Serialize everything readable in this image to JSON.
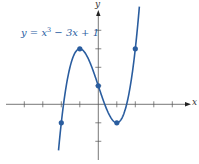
{
  "chart_data": {
    "type": "line",
    "title": "",
    "equation": {
      "prefix": "y = x",
      "exponent": "3",
      "suffix": " − 3x + 1"
    },
    "xlabel": "x",
    "ylabel": "y",
    "xlim": [
      -5,
      5
    ],
    "ylim": [
      -3,
      5
    ],
    "x_ticks": [
      -4,
      -3,
      -2,
      -1,
      1,
      2,
      3,
      4
    ],
    "y_ticks": [
      -2,
      -1,
      1,
      2,
      3,
      4
    ],
    "tick_labels_shown": false,
    "grid": false,
    "series": [
      {
        "name": "y = x^3 - 3x + 1",
        "color": "#2a5d9f",
        "domain": [
          -2.15,
          2.22
        ]
      }
    ],
    "points": [
      {
        "x": -2,
        "y": -1
      },
      {
        "x": -1,
        "y": 3
      },
      {
        "x": 0,
        "y": 1
      },
      {
        "x": 1,
        "y": -1
      },
      {
        "x": 2,
        "y": 3
      }
    ]
  },
  "colors": {
    "curve": "#2a5d9f",
    "axis": "#555555",
    "point": "#2a5d9f"
  }
}
